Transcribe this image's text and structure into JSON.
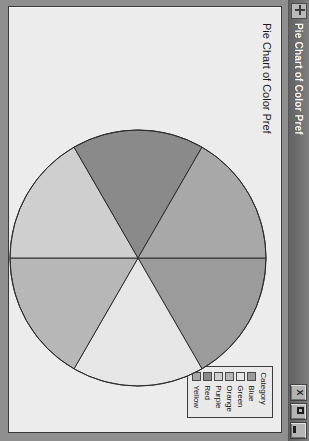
{
  "window": {
    "title": "Pie Chart of Color Pref",
    "icon": "move-crosshair-icon",
    "buttons": {
      "close": "X",
      "maximize": "",
      "minimize": ""
    }
  },
  "legend": {
    "title": "Category",
    "items": [
      {
        "label": "Blue",
        "swatch": "#9b9b9b"
      },
      {
        "label": "Green",
        "swatch": "#e6e6e6"
      },
      {
        "label": "Orange",
        "swatch": "#b7b7b7"
      },
      {
        "label": "Purple",
        "swatch": "#cfcfcf"
      },
      {
        "label": "Red",
        "swatch": "#8a8a8a"
      },
      {
        "label": "Yellow",
        "swatch": "#a8a8a8"
      }
    ]
  },
  "chart_data": {
    "type": "pie",
    "title": "Pie Chart of Color Pref",
    "xlabel": "",
    "ylabel": "",
    "legend_title": "Category",
    "legend_position": "top-right",
    "grid": false,
    "categories": [
      "Blue",
      "Green",
      "Orange",
      "Purple",
      "Red",
      "Yellow"
    ],
    "values": [
      1,
      1,
      1,
      1,
      1,
      1
    ],
    "percentages": [
      16.7,
      16.7,
      16.7,
      16.7,
      16.7,
      16.7
    ],
    "slice_angles_deg": [
      60,
      60,
      60,
      60,
      60,
      60
    ],
    "start_angle_deg": 90,
    "direction": "clockwise",
    "colors": [
      "#9b9b9b",
      "#e6e6e6",
      "#b7b7b7",
      "#cfcfcf",
      "#8a8a8a",
      "#a8a8a8"
    ],
    "stroke": "#2e2e2e",
    "labels_shown": false
  }
}
